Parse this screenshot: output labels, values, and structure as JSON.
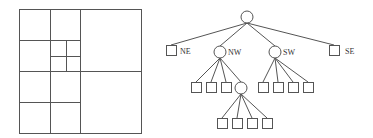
{
  "diagram": {
    "type": "quadtree",
    "grid": {
      "description": "Spatial subdivision of a square region into quadrants",
      "outer": {
        "x": 19,
        "y": 9,
        "w": 122,
        "h": 124
      },
      "vertical_lines": [
        {
          "x": 80,
          "y1": 9,
          "y2": 133
        },
        {
          "x": 50,
          "y1": 9,
          "y2": 133
        },
        {
          "x": 66,
          "y1": 40,
          "y2": 71
        }
      ],
      "horizontal_lines": [
        {
          "y": 71,
          "x1": 19,
          "x2": 141
        },
        {
          "y": 40,
          "x1": 19,
          "x2": 80
        },
        {
          "y": 102,
          "x1": 19,
          "x2": 80
        },
        {
          "y": 56,
          "x1": 50,
          "x2": 80
        }
      ]
    },
    "tree": {
      "root": {
        "cx": 247,
        "cy": 17,
        "r": 6
      },
      "children": [
        {
          "label": "NE",
          "kind": "leaf",
          "x": 166,
          "y": 45,
          "size": 10
        },
        {
          "label": "NW",
          "kind": "internal",
          "cx": 220,
          "cy": 52,
          "r": 6
        },
        {
          "label": "SW",
          "kind": "internal",
          "cx": 275,
          "cy": 52,
          "r": 6
        },
        {
          "label": "SE",
          "kind": "leaf",
          "x": 329,
          "y": 45,
          "size": 10
        }
      ],
      "nw_children": [
        {
          "kind": "leaf",
          "x": 191,
          "y": 82
        },
        {
          "kind": "leaf",
          "x": 206,
          "y": 82
        },
        {
          "kind": "leaf",
          "x": 221,
          "y": 82
        },
        {
          "kind": "internal",
          "cx": 241,
          "cy": 88,
          "r": 6
        }
      ],
      "sw_children": [
        {
          "kind": "leaf",
          "x": 258,
          "y": 82
        },
        {
          "kind": "leaf",
          "x": 273,
          "y": 82
        },
        {
          "kind": "leaf",
          "x": 288,
          "y": 82
        },
        {
          "kind": "leaf",
          "x": 303,
          "y": 82
        }
      ],
      "nw_se_children": [
        {
          "kind": "leaf",
          "x": 217,
          "y": 118
        },
        {
          "kind": "leaf",
          "x": 232,
          "y": 118
        },
        {
          "kind": "leaf",
          "x": 247,
          "y": 118
        },
        {
          "kind": "leaf",
          "x": 262,
          "y": 118
        }
      ]
    },
    "labels": {
      "ne": "NE",
      "nw": "NW",
      "sw": "SW",
      "se": "SE"
    },
    "colors": {
      "stroke": "#555555",
      "background": "#ffffff"
    }
  }
}
